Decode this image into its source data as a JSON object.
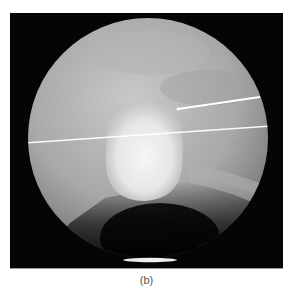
{
  "figure": {
    "caption": "(b)",
    "colors": {
      "background": "#050505",
      "field_light": "#c8c8c8",
      "field_mid": "#9a9a9a",
      "bright_structure": "#f2f2f2",
      "wire": "#ffffff"
    }
  }
}
